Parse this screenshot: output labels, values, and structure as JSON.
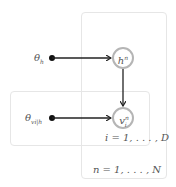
{
  "diagram": {
    "type": "plate-notation graphical model",
    "nodes": [
      {
        "id": "h",
        "label": "h",
        "superscript": "n",
        "kind": "latent"
      },
      {
        "id": "v",
        "label": "v",
        "superscript": "n",
        "subscript": "i",
        "kind": "latent"
      }
    ],
    "parameters": [
      {
        "id": "theta_h",
        "label": "θ",
        "subscript": "h"
      },
      {
        "id": "theta_v",
        "label": "θ",
        "subscript": "vi|h"
      }
    ],
    "edges": [
      {
        "from": "theta_h",
        "to": "h"
      },
      {
        "from": "h",
        "to": "v"
      },
      {
        "from": "theta_v",
        "to": "v"
      }
    ],
    "plates": [
      {
        "id": "outer",
        "label": "n = 1, . . . , N"
      },
      {
        "id": "inner",
        "label": "i = 1, . . . , D"
      }
    ]
  },
  "labels": {
    "theta": "θ",
    "theta_h_sub": "h",
    "theta_v_sub": "vi|h",
    "h_base": "h",
    "h_sup": "n",
    "v_base": "v",
    "v_sup": "n",
    "v_sub": "i",
    "outer_plate": "n = 1, . . . , N",
    "inner_plate": "i = 1, . . . , D"
  },
  "colors": {
    "node_border": "#b5b5b5",
    "plate_border": "#e6e6e6",
    "edge": "#222222",
    "text": "#555555"
  }
}
